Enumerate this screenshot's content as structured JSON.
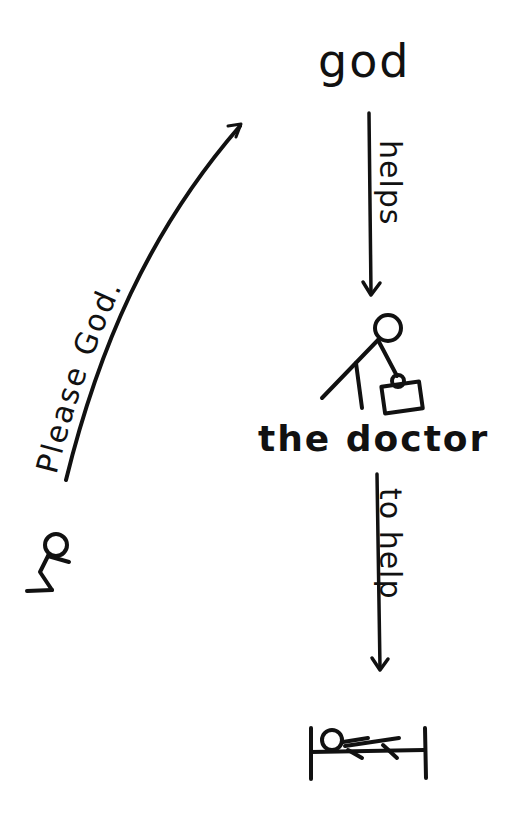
{
  "diagram": {
    "nodes": {
      "god": {
        "label": "god"
      },
      "doctor": {
        "label": "the doctor",
        "icon": "stick-figure-with-doctor-bag"
      },
      "petitioner": {
        "icon": "kneeling-stick-figure"
      },
      "patient": {
        "icon": "stick-figure-lying-in-bed"
      }
    },
    "edges": {
      "prayer": {
        "from": "petitioner",
        "to": "god",
        "label": "Please God."
      },
      "helps": {
        "from": "god",
        "to": "doctor",
        "label": "helps"
      },
      "to_help": {
        "from": "doctor",
        "to": "patient",
        "label": "to help"
      }
    },
    "stroke_color": "#111111",
    "background": "#ffffff"
  }
}
